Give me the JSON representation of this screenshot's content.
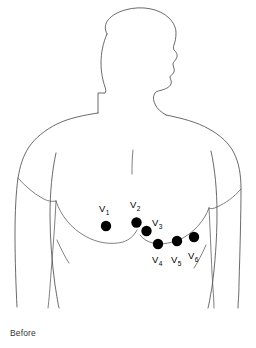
{
  "diagram": {
    "caption": "Before",
    "view": "anterior chest with head in right profile",
    "line_color": "#444444",
    "electrode_color": "#000000",
    "background_color": "#ffffff"
  },
  "electrodes": [
    {
      "id": "V1",
      "label_letter": "V",
      "label_sub": "1",
      "cx": 106,
      "cy": 226,
      "r": 5.2,
      "label_x": 99,
      "label_y": 212
    },
    {
      "id": "V2",
      "label_letter": "V",
      "label_sub": "2",
      "cx": 136.5,
      "cy": 222.5,
      "r": 5.2,
      "label_x": 130,
      "label_y": 208
    },
    {
      "id": "V3",
      "label_letter": "V",
      "label_sub": "3",
      "cx": 146.5,
      "cy": 231,
      "r": 5.2,
      "label_x": 152,
      "label_y": 226
    },
    {
      "id": "V4",
      "label_letter": "V",
      "label_sub": "4",
      "cx": 158,
      "cy": 244,
      "r": 5.2,
      "label_x": 152,
      "label_y": 263
    },
    {
      "id": "V5",
      "label_letter": "V",
      "label_sub": "5",
      "cx": 177,
      "cy": 241,
      "r": 5.2,
      "label_x": 171,
      "label_y": 263
    },
    {
      "id": "V6",
      "label_letter": "V",
      "label_sub": "6",
      "cx": 194,
      "cy": 237,
      "r": 5.2,
      "label_x": 188,
      "label_y": 259
    }
  ],
  "outline_paths": {
    "head_and_neck": "M 108 33 C 103 24 112 16 124 12 C 140 7 158 10 167 18 C 172 22 174 27 175 32 C 176 37 176 41 175 44 C 174 47 173 48 174 50 C 176 52 177 55 176 58 C 175 61 173 62 173 64 C 173 66 175 68 174 71 C 173 74 170 74 170 76 C 170 78 172 80 171 83 C 170 86 166 87 164 88 C 161 89 158 89 156 91 C 154 93 153 97 154 101 C 155 106 159 110 165 114",
    "head_back_neck": "M 108 33 C 104 42 102 52 102 62 C 102 72 104 80 106 86 C 107 89 107 91 106 92 L 99 92 L 99 112",
    "left_shoulder_arm": "M 99 112 C 86 114 70 117 58 123 C 46 129 36 137 30 146 C 24 155 21 165 19 176 C 17 190 16 210 16 232 C 16 258 17 285 18 305",
    "right_shoulder_arm": "M 165 114 C 180 117 196 121 208 128 C 219 134 228 142 233 152 C 238 162 240 174 240 188 C 240 212 239 250 238 282 C 238 294 237 302 237 308",
    "left_torso_side": "M 56 152 C 52 170 50 192 50 214 C 50 238 52 262 55 284 C 57 296 58 303 59 308",
    "right_torso_side": "M 210 150 C 214 168 216 190 216 212 C 216 238 214 264 211 286 C 209 297 208 304 207 308",
    "left_armpit": "M 19 176 C 26 184 34 191 43 196 C 48 199 52 200 56 200",
    "right_armpit": "M 240 188 C 233 195 225 201 216 205 C 212 207 210 207 208 207",
    "left_inner_arm": "M 56 200 C 55 222 53 248 51 272 C 50 287 49 299 48 308",
    "right_inner_arm": "M 208 207 C 209 226 210 250 211 272 C 212 288 213 300 213 308",
    "sternum_line": "M 132 151 C 131 158 131 166 131 172",
    "left_pectoral": "M 56 200 C 62 214 72 226 86 234 C 98 241 112 244 124 241 C 130 239 134 235 136 230",
    "right_pectoral": "M 208 207 C 203 219 194 229 182 236 C 172 241 161 243 152 241 C 146 239 141 236 138 232",
    "left_flank_crease": "M 58 239 C 62 248 66 256 70 262",
    "right_flank_crease": "M 205 243 C 201 252 197 260 193 266"
  }
}
